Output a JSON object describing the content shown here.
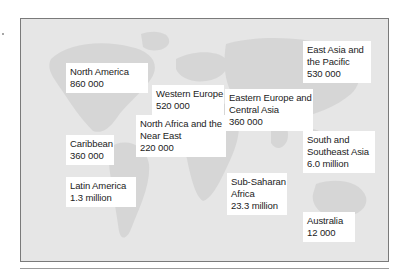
{
  "map": {
    "background_color": "#e6e6e6",
    "land_color": "#d4d4d4",
    "regions": [
      {
        "id": "north-america",
        "name": "North America",
        "lines": [
          "North America"
        ],
        "value": "860 000"
      },
      {
        "id": "western-europe",
        "name": "Western Europe",
        "lines": [
          "Western Europe"
        ],
        "value": "520 000"
      },
      {
        "id": "east-asia-pacific",
        "name": "East Asia and the Pacific",
        "lines": [
          "East Asia and",
          "the Pacific"
        ],
        "value": "530 000"
      },
      {
        "id": "eastern-europe-central-asia",
        "name": "Eastern Europe and Central Asia",
        "lines": [
          "Eastern Europe and",
          "Central Asia"
        ],
        "value": "360 000"
      },
      {
        "id": "north-africa-near-east",
        "name": "North Africa and the Near East",
        "lines": [
          "North Africa and the",
          "Near East"
        ],
        "value": "220 000"
      },
      {
        "id": "caribbean",
        "name": "Caribbean",
        "lines": [
          "Caribbean"
        ],
        "value": "360 000"
      },
      {
        "id": "south-southeast-asia",
        "name": "South and Southeast Asia",
        "lines": [
          "South and",
          "Southeast Asia"
        ],
        "value": "6.0 million"
      },
      {
        "id": "latin-america",
        "name": "Latin America",
        "lines": [
          "Latin America"
        ],
        "value": "1.3 million"
      },
      {
        "id": "sub-saharan-africa",
        "name": "Sub-Saharan Africa",
        "lines": [
          "Sub-Saharan",
          "Africa"
        ],
        "value": "23.3 million"
      },
      {
        "id": "australia",
        "name": "Australia",
        "lines": [
          "Australia"
        ],
        "value": "12 000"
      }
    ]
  }
}
